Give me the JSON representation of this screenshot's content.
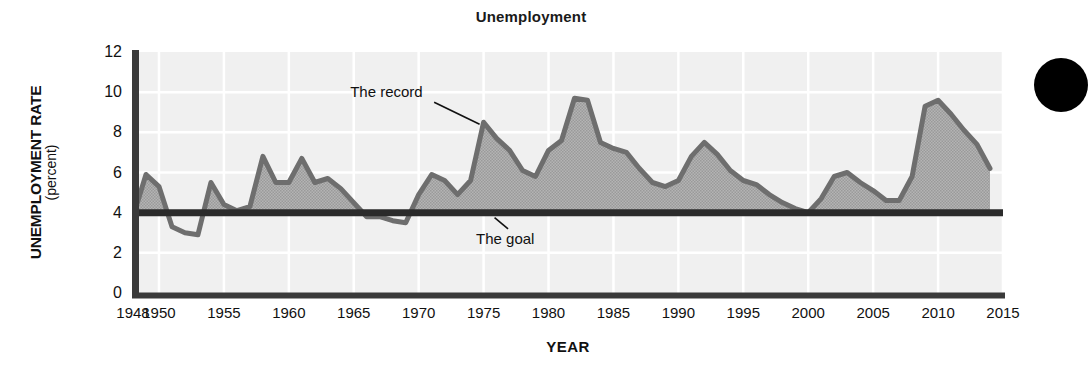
{
  "chart_data": {
    "type": "area",
    "title": "Unemployment",
    "xlabel": "YEAR",
    "ylabel": "UNEMPLOYMENT RATE",
    "ylabel_units": "(percent)",
    "xlim": [
      1948,
      2015
    ],
    "ylim": [
      0,
      12
    ],
    "yticks": [
      12,
      10,
      8,
      6,
      4,
      2,
      0
    ],
    "xticks": [
      1948,
      1950,
      1955,
      1960,
      1965,
      1970,
      1975,
      1980,
      1985,
      1990,
      1995,
      2000,
      2005,
      2010,
      2015
    ],
    "grid": true,
    "legend": "none",
    "annotations": [
      {
        "text": "The record",
        "x": 1971.5,
        "y": 10.0,
        "points_to_x": 1975.0,
        "points_to_y": 8.5
      },
      {
        "text": "The goal",
        "x": 1977.5,
        "y": 2.7,
        "points_to_x": 1976.0,
        "points_to_y": 4.0
      }
    ],
    "series": [
      {
        "name": "The record",
        "kind": "area",
        "color": "#6e6e6e",
        "fill": "#a9a9a9",
        "baseline": 4.0,
        "x": [
          1948,
          1949,
          1950,
          1951,
          1952,
          1953,
          1954,
          1955,
          1956,
          1957,
          1958,
          1959,
          1960,
          1961,
          1962,
          1963,
          1964,
          1965,
          1966,
          1967,
          1968,
          1969,
          1970,
          1971,
          1972,
          1973,
          1974,
          1975,
          1976,
          1977,
          1978,
          1979,
          1980,
          1981,
          1982,
          1983,
          1984,
          1985,
          1986,
          1987,
          1988,
          1989,
          1990,
          1991,
          1992,
          1993,
          1994,
          1995,
          1996,
          1997,
          1998,
          1999,
          2000,
          2001,
          2002,
          2003,
          2004,
          2005,
          2006,
          2007,
          2008,
          2009,
          2010,
          2011,
          2012,
          2013,
          2014
        ],
        "values": [
          3.8,
          5.9,
          5.3,
          3.3,
          3.0,
          2.9,
          5.5,
          4.4,
          4.1,
          4.3,
          6.8,
          5.5,
          5.5,
          6.7,
          5.5,
          5.7,
          5.2,
          4.5,
          3.8,
          3.8,
          3.6,
          3.5,
          4.9,
          5.9,
          5.6,
          4.9,
          5.6,
          8.5,
          7.7,
          7.1,
          6.1,
          5.8,
          7.1,
          7.6,
          9.7,
          9.6,
          7.5,
          7.2,
          7.0,
          6.2,
          5.5,
          5.3,
          5.6,
          6.8,
          7.5,
          6.9,
          6.1,
          5.6,
          5.4,
          4.9,
          4.5,
          4.2,
          4.0,
          4.7,
          5.8,
          6.0,
          5.5,
          5.1,
          4.6,
          4.6,
          5.8,
          9.3,
          9.6,
          8.9,
          8.1,
          7.4,
          6.2
        ]
      },
      {
        "name": "The goal",
        "kind": "line",
        "color": "#2b2b2b",
        "constant": 4.0
      }
    ]
  },
  "page_marker": {
    "name": "page-corner-dot",
    "color": "#000000"
  }
}
